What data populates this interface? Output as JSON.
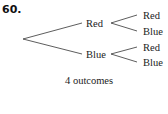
{
  "problem_number": "60.",
  "tree": {
    "level1": [
      {
        "label": "Red",
        "children": [
          "Red",
          "Blue"
        ]
      },
      {
        "label": "Blue",
        "children": [
          "Red",
          "Blue"
        ]
      }
    ]
  },
  "caption": "4 outcomes",
  "colors": {
    "line": "#333333",
    "text": "#222222"
  }
}
